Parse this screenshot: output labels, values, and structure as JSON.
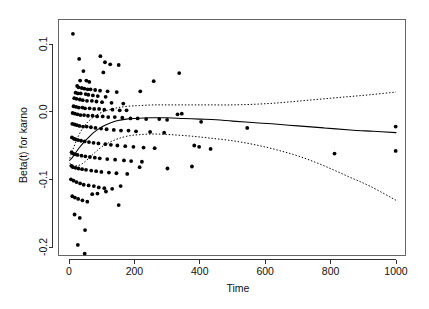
{
  "chart_data": {
    "type": "scatter",
    "title": "",
    "xlabel": "Time",
    "ylabel": "Beta(t) for karno",
    "xlim": [
      -25,
      1030
    ],
    "ylim": [
      -0.225,
      0.125
    ],
    "xticks": [
      0,
      200,
      400,
      600,
      800,
      1000
    ],
    "xticklabels": [
      "0",
      "200",
      "400",
      "600",
      "800",
      "1000"
    ],
    "yticks": [
      0.1,
      0.0,
      -0.1,
      -0.2
    ],
    "yticklabels": [
      "0.1",
      "0.0",
      "-0.1",
      "-0.2"
    ],
    "grid": false,
    "legend": null,
    "series": [
      {
        "name": "scaled Schoenfeld residuals",
        "type": "scatter",
        "marker": "filled-circle",
        "color": "#000000",
        "points": [
          [
            12,
            0.115
          ],
          [
            31,
            0.078
          ],
          [
            96,
            0.082
          ],
          [
            110,
            0.073
          ],
          [
            126,
            0.07
          ],
          [
            152,
            0.069
          ],
          [
            44,
            0.06
          ],
          [
            105,
            0.058
          ],
          [
            337,
            0.057
          ],
          [
            34,
            0.046
          ],
          [
            53,
            0.046
          ],
          [
            62,
            0.044
          ],
          [
            25,
            0.038
          ],
          [
            29,
            0.036
          ],
          [
            39,
            0.035
          ],
          [
            47,
            0.034
          ],
          [
            57,
            0.033
          ],
          [
            66,
            0.033
          ],
          [
            80,
            0.032
          ],
          [
            95,
            0.031
          ],
          [
            118,
            0.03
          ],
          [
            146,
            0.029
          ],
          [
            20,
            0.028
          ],
          [
            27,
            0.027
          ],
          [
            36,
            0.027
          ],
          [
            51,
            0.026
          ],
          [
            59,
            0.025
          ],
          [
            73,
            0.024
          ],
          [
            88,
            0.023
          ],
          [
            112,
            0.022
          ],
          [
            218,
            0.03
          ],
          [
            259,
            0.045
          ],
          [
            16,
            0.02
          ],
          [
            23,
            0.019
          ],
          [
            33,
            0.018
          ],
          [
            42,
            0.017
          ],
          [
            55,
            0.016
          ],
          [
            70,
            0.016
          ],
          [
            84,
            0.015
          ],
          [
            101,
            0.014
          ],
          [
            130,
            0.013
          ],
          [
            166,
            0.012
          ],
          [
            14,
            0.008
          ],
          [
            22,
            0.007
          ],
          [
            30,
            0.006
          ],
          [
            41,
            0.006
          ],
          [
            49,
            0.005
          ],
          [
            63,
            0.005
          ],
          [
            77,
            0.004
          ],
          [
            92,
            0.004
          ],
          [
            108,
            0.003
          ],
          [
            133,
            0.003
          ],
          [
            155,
            0.002
          ],
          [
            176,
            0.002
          ],
          [
            11,
            -0.002
          ],
          [
            18,
            -0.003
          ],
          [
            26,
            -0.004
          ],
          [
            35,
            -0.005
          ],
          [
            46,
            -0.005
          ],
          [
            58,
            -0.006
          ],
          [
            72,
            -0.006
          ],
          [
            86,
            -0.007
          ],
          [
            103,
            -0.007
          ],
          [
            120,
            -0.008
          ],
          [
            140,
            -0.008
          ],
          [
            163,
            -0.009
          ],
          [
            188,
            -0.01
          ],
          [
            210,
            -0.01
          ],
          [
            236,
            -0.011
          ],
          [
            276,
            -0.011
          ],
          [
            300,
            -0.012
          ],
          [
            332,
            -0.004
          ],
          [
            345,
            -0.003
          ],
          [
            404,
            -0.015
          ],
          [
            10,
            -0.018
          ],
          [
            17,
            -0.019
          ],
          [
            24,
            -0.02
          ],
          [
            32,
            -0.021
          ],
          [
            43,
            -0.022
          ],
          [
            54,
            -0.022
          ],
          [
            67,
            -0.023
          ],
          [
            81,
            -0.024
          ],
          [
            98,
            -0.025
          ],
          [
            115,
            -0.026
          ],
          [
            137,
            -0.027
          ],
          [
            159,
            -0.028
          ],
          [
            182,
            -0.028
          ],
          [
            205,
            -0.029
          ],
          [
            248,
            -0.03
          ],
          [
            291,
            -0.031
          ],
          [
            545,
            -0.024
          ],
          [
            999,
            -0.022
          ],
          [
            9,
            -0.038
          ],
          [
            15,
            -0.04
          ],
          [
            21,
            -0.041
          ],
          [
            28,
            -0.042
          ],
          [
            37,
            -0.043
          ],
          [
            48,
            -0.044
          ],
          [
            61,
            -0.045
          ],
          [
            75,
            -0.046
          ],
          [
            90,
            -0.047
          ],
          [
            111,
            -0.048
          ],
          [
            128,
            -0.049
          ],
          [
            148,
            -0.05
          ],
          [
            172,
            -0.051
          ],
          [
            197,
            -0.052
          ],
          [
            228,
            -0.053
          ],
          [
            262,
            -0.054
          ],
          [
            383,
            -0.05
          ],
          [
            398,
            -0.052
          ],
          [
            433,
            -0.055
          ],
          [
            8,
            -0.06
          ],
          [
            13,
            -0.062
          ],
          [
            19,
            -0.063
          ],
          [
            26,
            -0.064
          ],
          [
            38,
            -0.065
          ],
          [
            50,
            -0.066
          ],
          [
            64,
            -0.067
          ],
          [
            79,
            -0.068
          ],
          [
            94,
            -0.069
          ],
          [
            117,
            -0.07
          ],
          [
            141,
            -0.071
          ],
          [
            168,
            -0.072
          ],
          [
            190,
            -0.073
          ],
          [
            223,
            -0.074
          ],
          [
            812,
            -0.062
          ],
          [
            999,
            -0.058
          ],
          [
            7,
            -0.08
          ],
          [
            12,
            -0.082
          ],
          [
            20,
            -0.083
          ],
          [
            29,
            -0.084
          ],
          [
            40,
            -0.085
          ],
          [
            52,
            -0.086
          ],
          [
            68,
            -0.087
          ],
          [
            83,
            -0.088
          ],
          [
            99,
            -0.089
          ],
          [
            122,
            -0.09
          ],
          [
            145,
            -0.091
          ],
          [
            178,
            -0.092
          ],
          [
            216,
            -0.082
          ],
          [
            301,
            -0.084
          ],
          [
            376,
            -0.081
          ],
          [
            6,
            -0.1
          ],
          [
            14,
            -0.102
          ],
          [
            23,
            -0.104
          ],
          [
            34,
            -0.106
          ],
          [
            45,
            -0.108
          ],
          [
            60,
            -0.109
          ],
          [
            76,
            -0.11
          ],
          [
            91,
            -0.112
          ],
          [
            108,
            -0.113
          ],
          [
            132,
            -0.114
          ],
          [
            158,
            -0.11
          ],
          [
            10,
            -0.125
          ],
          [
            18,
            -0.127
          ],
          [
            28,
            -0.129
          ],
          [
            41,
            -0.131
          ],
          [
            56,
            -0.133
          ],
          [
            71,
            -0.122
          ],
          [
            87,
            -0.121
          ],
          [
            113,
            -0.118
          ],
          [
            152,
            -0.138
          ],
          [
            17,
            -0.152
          ],
          [
            33,
            -0.157
          ],
          [
            49,
            -0.175
          ],
          [
            27,
            -0.197
          ],
          [
            48,
            -0.21
          ]
        ]
      },
      {
        "name": "smoothed fit",
        "type": "line",
        "style": "solid",
        "color": "#000000",
        "points": [
          [
            2,
            -0.072
          ],
          [
            10,
            -0.068
          ],
          [
            20,
            -0.061
          ],
          [
            32,
            -0.053
          ],
          [
            46,
            -0.045
          ],
          [
            60,
            -0.038
          ],
          [
            75,
            -0.031
          ],
          [
            92,
            -0.025
          ],
          [
            110,
            -0.02
          ],
          [
            130,
            -0.016
          ],
          [
            150,
            -0.013
          ],
          [
            175,
            -0.011
          ],
          [
            200,
            -0.01
          ],
          [
            250,
            -0.009
          ],
          [
            300,
            -0.009
          ],
          [
            350,
            -0.01
          ],
          [
            400,
            -0.011
          ],
          [
            450,
            -0.012
          ],
          [
            500,
            -0.014
          ],
          [
            560,
            -0.016
          ],
          [
            620,
            -0.018
          ],
          [
            700,
            -0.021
          ],
          [
            780,
            -0.024
          ],
          [
            860,
            -0.027
          ],
          [
            930,
            -0.029
          ],
          [
            1000,
            -0.031
          ]
        ]
      },
      {
        "name": "upper confidence band",
        "type": "line",
        "style": "dotted",
        "color": "#000000",
        "points": [
          [
            2,
            -0.069
          ],
          [
            12,
            -0.056
          ],
          [
            25,
            -0.04
          ],
          [
            40,
            -0.026
          ],
          [
            58,
            -0.015
          ],
          [
            78,
            -0.007
          ],
          [
            100,
            -0.001
          ],
          [
            125,
            0.003
          ],
          [
            150,
            0.006
          ],
          [
            180,
            0.008
          ],
          [
            215,
            0.009
          ],
          [
            260,
            0.01
          ],
          [
            310,
            0.01
          ],
          [
            370,
            0.01
          ],
          [
            430,
            0.01
          ],
          [
            500,
            0.01
          ],
          [
            570,
            0.011
          ],
          [
            640,
            0.013
          ],
          [
            710,
            0.016
          ],
          [
            780,
            0.019
          ],
          [
            850,
            0.022
          ],
          [
            920,
            0.025
          ],
          [
            1000,
            0.029
          ]
        ]
      },
      {
        "name": "lower confidence band",
        "type": "line",
        "style": "dotted",
        "color": "#000000",
        "points": [
          [
            2,
            -0.076
          ],
          [
            12,
            -0.079
          ],
          [
            25,
            -0.08
          ],
          [
            40,
            -0.077
          ],
          [
            58,
            -0.07
          ],
          [
            78,
            -0.061
          ],
          [
            100,
            -0.052
          ],
          [
            125,
            -0.045
          ],
          [
            150,
            -0.04
          ],
          [
            180,
            -0.036
          ],
          [
            215,
            -0.034
          ],
          [
            260,
            -0.033
          ],
          [
            310,
            -0.034
          ],
          [
            370,
            -0.036
          ],
          [
            430,
            -0.039
          ],
          [
            500,
            -0.043
          ],
          [
            570,
            -0.049
          ],
          [
            640,
            -0.057
          ],
          [
            710,
            -0.067
          ],
          [
            780,
            -0.08
          ],
          [
            850,
            -0.095
          ],
          [
            920,
            -0.11
          ],
          [
            1000,
            -0.131
          ]
        ]
      }
    ]
  },
  "axes": {
    "x_title": "Time",
    "y_title": "Beta(t) for karno"
  }
}
